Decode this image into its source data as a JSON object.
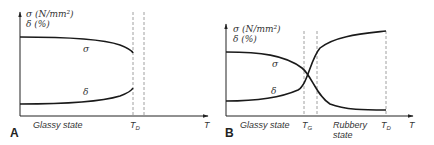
{
  "panels": [
    {
      "id": "A",
      "y_label_line1": "σ (N/mm²)",
      "y_label_line2": "δ (%)",
      "x_label": "T",
      "curve_labels": {
        "sigma": "σ",
        "delta": "δ"
      },
      "regions": [
        "Glassy state"
      ],
      "markers": [
        {
          "symbol": "T",
          "sub": "D"
        }
      ]
    },
    {
      "id": "B",
      "y_label_line1": "σ (N/mm²)",
      "y_label_line2": "δ (%)",
      "x_label": "T",
      "curve_labels": {
        "sigma": "σ",
        "delta": "δ"
      },
      "regions": [
        "Glassy state",
        "Rubbery",
        "state"
      ],
      "markers": [
        {
          "symbol": "T",
          "sub": "G"
        },
        {
          "symbol": "T",
          "sub": "D"
        }
      ]
    }
  ],
  "colors": {
    "curve": "#1a1a1a",
    "axis": "#222222",
    "dashed": "#888888"
  }
}
